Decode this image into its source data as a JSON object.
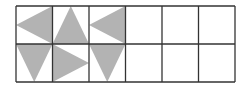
{
  "diagram": {
    "grid": {
      "rows": 2,
      "cols": 6,
      "x0": 16,
      "y0": 6,
      "cell_w": 36.5,
      "cell_h": 38
    },
    "colors": {
      "line": "#333333",
      "fill": "#b3b3b3",
      "background": "#ffffff"
    },
    "cells": [
      {
        "row": 0,
        "col": 0,
        "shape": "triangle-pointing-left"
      },
      {
        "row": 0,
        "col": 1,
        "shape": "triangle-pointing-up"
      },
      {
        "row": 0,
        "col": 2,
        "shape": "triangle-pointing-left"
      },
      {
        "row": 1,
        "col": 0,
        "shape": "triangle-pointing-down"
      },
      {
        "row": 1,
        "col": 1,
        "shape": "triangle-pointing-right"
      },
      {
        "row": 1,
        "col": 2,
        "shape": "triangle-pointing-down"
      }
    ]
  }
}
